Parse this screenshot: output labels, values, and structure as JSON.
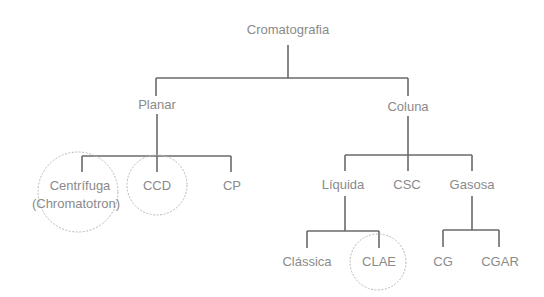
{
  "diagram": {
    "type": "tree",
    "root": "Cromatografia",
    "nodes": {
      "root": {
        "label": "Cromatografia"
      },
      "planar": {
        "label": "Planar"
      },
      "coluna": {
        "label": "Coluna"
      },
      "centrifuga": {
        "label_line1": "Centrífuga",
        "label_line2": "(Chromatotron)"
      },
      "ccd": {
        "label": "CCD"
      },
      "cp": {
        "label": "CP"
      },
      "liquida": {
        "label": "Líquida"
      },
      "csc": {
        "label": "CSC"
      },
      "gasosa": {
        "label": "Gasosa"
      },
      "classica": {
        "label": "Clássica"
      },
      "clae": {
        "label": "CLAE"
      },
      "cg": {
        "label": "CG"
      },
      "cgar": {
        "label": "CGAR"
      }
    },
    "edges": [
      [
        "Cromatografia",
        "Planar"
      ],
      [
        "Cromatografia",
        "Coluna"
      ],
      [
        "Planar",
        "Centrífuga (Chromatotron)"
      ],
      [
        "Planar",
        "CCD"
      ],
      [
        "Planar",
        "CP"
      ],
      [
        "Coluna",
        "Líquida"
      ],
      [
        "Coluna",
        "CSC"
      ],
      [
        "Coluna",
        "Gasosa"
      ],
      [
        "Líquida",
        "Clássica"
      ],
      [
        "Líquida",
        "CLAE"
      ],
      [
        "Gasosa",
        "CG"
      ],
      [
        "Gasosa",
        "CGAR"
      ]
    ],
    "highlighted": [
      "Centrífuga (Chromatotron)",
      "CCD",
      "CLAE"
    ],
    "colors": {
      "text": "#8a8a8a",
      "lines": "#6a6a6a",
      "highlight_circle": "#b8b8b8"
    }
  }
}
